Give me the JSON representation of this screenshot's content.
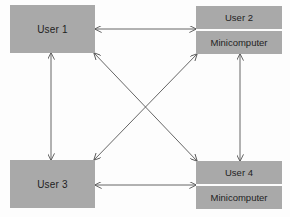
{
  "diagram": {
    "type": "network-topology",
    "colors": {
      "box_fill": "#a9a9a9",
      "text": "#1e1e1e",
      "line": "#555555",
      "background": "#fdfdfd"
    },
    "nodes": [
      {
        "id": "user1",
        "label": "User 1",
        "sublabel": null
      },
      {
        "id": "user2",
        "label": "User 2",
        "sublabel": "Minicomputer"
      },
      {
        "id": "user3",
        "label": "User 3",
        "sublabel": null
      },
      {
        "id": "user4",
        "label": "User 4",
        "sublabel": "Minicomputer"
      }
    ],
    "edges": [
      {
        "from": "user1",
        "to": "user2",
        "direction": "bidirectional"
      },
      {
        "from": "user3",
        "to": "user4",
        "direction": "bidirectional"
      },
      {
        "from": "user1",
        "to": "user3",
        "direction": "bidirectional"
      },
      {
        "from": "user2",
        "to": "user4",
        "direction": "bidirectional"
      },
      {
        "from": "user1",
        "to": "user4",
        "direction": "bidirectional"
      },
      {
        "from": "user2",
        "to": "user3",
        "direction": "bidirectional"
      }
    ]
  }
}
